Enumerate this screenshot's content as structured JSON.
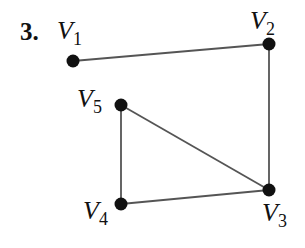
{
  "problem_number": "3.",
  "graph": {
    "vertices": [
      {
        "id": "V1",
        "letter": "V",
        "sub": "1",
        "x": 73,
        "y": 61
      },
      {
        "id": "V2",
        "letter": "V",
        "sub": "2",
        "x": 269,
        "y": 44
      },
      {
        "id": "V3",
        "letter": "V",
        "sub": "3",
        "x": 269,
        "y": 190
      },
      {
        "id": "V4",
        "letter": "V",
        "sub": "4",
        "x": 121,
        "y": 204
      },
      {
        "id": "V5",
        "letter": "V",
        "sub": "5",
        "x": 121,
        "y": 105
      }
    ],
    "edges": [
      [
        "V1",
        "V2"
      ],
      [
        "V2",
        "V3"
      ],
      [
        "V5",
        "V3"
      ],
      [
        "V5",
        "V4"
      ],
      [
        "V4",
        "V3"
      ]
    ]
  },
  "colors": {
    "stroke": "#555555",
    "node": "#111111"
  }
}
